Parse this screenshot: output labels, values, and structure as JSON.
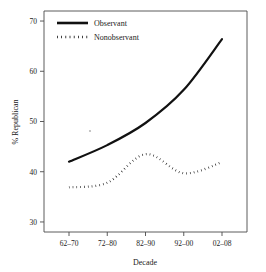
{
  "chart_data": {
    "type": "line",
    "title": "",
    "xlabel": "Decade",
    "ylabel": "% Republican",
    "categories": [
      "62–70",
      "72–80",
      "82–90",
      "92–00",
      "02–08"
    ],
    "ylim": [
      28,
      72
    ],
    "yticks": [
      30,
      40,
      50,
      60,
      70
    ],
    "ytick_labels": [
      "30",
      "40",
      "50",
      "60",
      "70"
    ],
    "grid": false,
    "legend_position": "top-left",
    "series": [
      {
        "name": "Observant",
        "style": "solid",
        "color": "#111111",
        "values": [
          42.0,
          45.3,
          49.7,
          56.3,
          66.4
        ]
      },
      {
        "name": "Nonobservant",
        "style": "dotted",
        "color": "#111111",
        "values": [
          36.9,
          37.8,
          43.5,
          39.7,
          41.9
        ]
      }
    ]
  },
  "axes": {
    "y_title": "% Republican",
    "x_title": "Decade"
  },
  "legend": {
    "items": [
      {
        "label": "Observant",
        "style": "solid"
      },
      {
        "label": "Nonobservant",
        "style": "dotted"
      }
    ]
  }
}
